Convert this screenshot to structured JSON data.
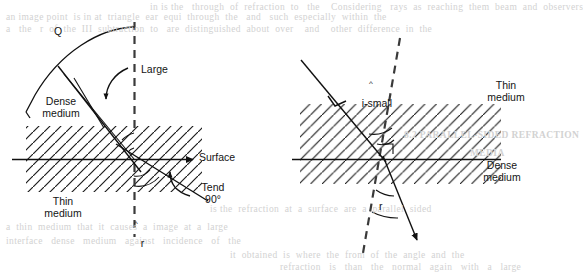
{
  "figure": {
    "kind": "optics-refraction-diagram",
    "caption_absent": true,
    "stroke_color": "#111111",
    "background_color": "#ffffff",
    "ghost_text_color": "#d2d2d2"
  },
  "left_diagram": {
    "name": "critical-angle-grazing-refraction",
    "labels": {
      "angle_q": "Q",
      "large": "Large",
      "dense_medium": "Dense\nmedium",
      "thin_medium": "Thin\nmedium",
      "surface": "Surface",
      "tend_90": "Tend\n90°",
      "refracted_ray": "r",
      "refracted_ray_hat": "^"
    },
    "geometry": {
      "incidence_point": [
        134,
        159
      ],
      "surface_line": {
        "x1": 12,
        "y1": 159,
        "x2": 196,
        "y2": 159,
        "arrow": "right"
      },
      "normal_dashed": {
        "x1": 134,
        "y1": 22,
        "x2": 134,
        "y2": 236
      },
      "hatched_band": {
        "x": 26,
        "y": 126,
        "w": 176,
        "h": 66,
        "hatch_direction": "forward-slash"
      },
      "incident_ray": {
        "from": [
          60,
          70
        ],
        "to": [
          139,
          168
        ]
      },
      "refracted_ray": {
        "from": [
          126,
          150
        ],
        "to": [
          204,
          199
        ]
      },
      "arc_radius_px": 132,
      "arc_from_angle_deg": 90,
      "arc_to_angle_deg": 172
    }
  },
  "right_diagram": {
    "name": "small-angle-refraction",
    "labels": {
      "i_small": "i-small",
      "i_small_hat": "^",
      "thin_medium": "Thin\nmedium",
      "dense_medium": "Dense\nmedium",
      "refracted_ray": "r"
    },
    "geometry": {
      "incidence_point": [
        384,
        159
      ],
      "surface_line": {
        "x1": 292,
        "y1": 159,
        "x2": 500,
        "y2": 159
      },
      "normal_dashed": {
        "x1": 398,
        "y1": 38,
        "x2": 364,
        "y2": 253
      },
      "hatched_band": {
        "x": 300,
        "y": 104,
        "w": 200,
        "h": 80,
        "hatch_direction": "forward-slash"
      },
      "incident_ray": {
        "from": [
          303,
          62
        ],
        "to": [
          384,
          159
        ]
      },
      "refracted_ray": {
        "from": [
          384,
          159
        ],
        "to": [
          418,
          243
        ],
        "arrow": "end"
      }
    }
  },
  "ghost_lines": [
    {
      "text": "an image point  is in at  triangle  ear  equi  through  the   and   such  especially  within  the",
      "x": 6,
      "y": 15
    },
    {
      "text": "a   the   r  of  the  III  subtraction  to   are  distinguished  about  over    and    other  difference  in  the",
      "x": 6,
      "y": 27
    },
    {
      "text": "in is the   through  of  refraction  to   the    Considering   rays  as  reaching  them  beam  and  observers",
      "x": 96,
      "y": 6
    },
    {
      "text": "8.2 PARALLEL-SIDED REFRACTION",
      "x": 404,
      "y": 133
    },
    {
      "text": "a  thin  medium  that  it  causes  a  image  at  a  large",
      "x": 6,
      "y": 224
    },
    {
      "text": "interface   dense   medium   against   incidence   of   the",
      "x": 6,
      "y": 238
    },
    {
      "text": "is the  refraction  at  a  surface  are  a  parallel  sided",
      "x": 200,
      "y": 206
    },
    {
      "text": "MEDIA",
      "x": 470,
      "y": 150
    },
    {
      "text": "it  obtained  is  where  the  from  of  the  angle  and  the",
      "x": 220,
      "y": 226
    },
    {
      "text": "refraction   is   than   the   normal   again   with   a   large",
      "x": 260,
      "y": 246
    },
    {
      "text": "8.2 REFRACTION",
      "x": 404,
      "y": 108
    }
  ]
}
